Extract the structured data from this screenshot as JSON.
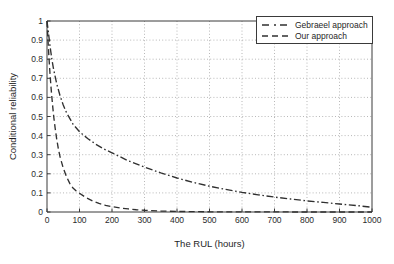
{
  "chart_data": {
    "type": "line",
    "title": "",
    "xlabel": "The RUL (hours)",
    "ylabel": "Conditional reliability",
    "xlim": [
      0,
      1000
    ],
    "ylim": [
      0,
      1
    ],
    "grid": true,
    "legend_position": "top-right",
    "xticks": [
      0,
      100,
      200,
      300,
      400,
      500,
      600,
      700,
      800,
      900,
      1000
    ],
    "xtick_labels": [
      "0",
      "100",
      "200",
      "300",
      "400",
      "500",
      "600",
      "700",
      "800",
      "900",
      "1000"
    ],
    "yticks": [
      0,
      0.1,
      0.2,
      0.3,
      0.4,
      0.5,
      0.6,
      0.7,
      0.8,
      0.9,
      1
    ],
    "ytick_labels": [
      "0",
      "0.1",
      "0.2",
      "0.3",
      "0.4",
      "0.5",
      "0.6",
      "0.7",
      "0.8",
      "0.9",
      "1"
    ],
    "series": [
      {
        "name": "Gebraeel approach",
        "style": "dashdot",
        "color": "#303030",
        "x": [
          0,
          5,
          10,
          15,
          20,
          25,
          30,
          40,
          50,
          60,
          80,
          100,
          125,
          150,
          175,
          200,
          250,
          300,
          350,
          400,
          450,
          500,
          550,
          600,
          650,
          700,
          750,
          800,
          850,
          900,
          950,
          1000
        ],
        "y": [
          1.0,
          0.93,
          0.86,
          0.8,
          0.75,
          0.71,
          0.67,
          0.61,
          0.56,
          0.52,
          0.46,
          0.42,
          0.385,
          0.355,
          0.33,
          0.31,
          0.268,
          0.235,
          0.205,
          0.178,
          0.155,
          0.135,
          0.118,
          0.103,
          0.09,
          0.078,
          0.068,
          0.058,
          0.05,
          0.042,
          0.034,
          0.025
        ]
      },
      {
        "name": "Our approach",
        "style": "dashed",
        "color": "#303030",
        "x": [
          0,
          3,
          6,
          9,
          12,
          15,
          18,
          21,
          25,
          30,
          35,
          40,
          50,
          60,
          70,
          80,
          90,
          100,
          120,
          140,
          160,
          180,
          200,
          225,
          250,
          275,
          300,
          350,
          400,
          450,
          500,
          600,
          700,
          800,
          900,
          1000
        ],
        "y": [
          1.0,
          0.9,
          0.81,
          0.73,
          0.66,
          0.6,
          0.545,
          0.495,
          0.44,
          0.38,
          0.33,
          0.29,
          0.23,
          0.185,
          0.15,
          0.125,
          0.11,
          0.098,
          0.075,
          0.058,
          0.045,
          0.035,
          0.028,
          0.021,
          0.016,
          0.012,
          0.009,
          0.005,
          0.003,
          0.002,
          0.001,
          0.0005,
          0.0003,
          0.0002,
          0.0001,
          0.0001
        ]
      }
    ]
  },
  "legend": {
    "entries": [
      {
        "label": "Gebraeel approach"
      },
      {
        "label": "Our approach"
      }
    ]
  }
}
